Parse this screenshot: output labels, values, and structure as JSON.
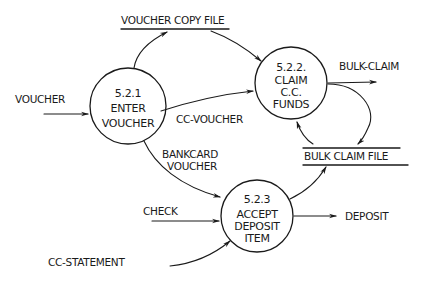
{
  "diagram": {
    "type": "data-flow-diagram",
    "style": "hand-drawn",
    "colors": {
      "ink": "#1a1a1a",
      "background": "#ffffff"
    },
    "processes": [
      {
        "id": "5.2.1",
        "number": "5.2.1",
        "lines": [
          "ENTER",
          "VOUCHER"
        ]
      },
      {
        "id": "5.2.2",
        "number": "5.2.2.",
        "lines": [
          "CLAIM",
          "C.C.",
          "FUNDS"
        ]
      },
      {
        "id": "5.2.3",
        "number": "5.2.3",
        "lines": [
          "ACCEPT",
          "DEPOSIT",
          "ITEM"
        ]
      }
    ],
    "data_stores": [
      {
        "id": "voucher-copy-file",
        "label": "VOUCHER COPY FILE"
      },
      {
        "id": "bulk-claim-file",
        "label": "BULK CLAIM FILE"
      }
    ],
    "flows": [
      {
        "label": "VOUCHER",
        "from": "external",
        "to": "5.2.1"
      },
      {
        "label": "",
        "from": "5.2.1",
        "to": "voucher-copy-file"
      },
      {
        "label": "",
        "from": "voucher-copy-file",
        "to": "5.2.2"
      },
      {
        "label": "CC-VOUCHER",
        "from": "5.2.1",
        "to": "5.2.2"
      },
      {
        "label": "BULK-CLAIM",
        "from": "5.2.2",
        "to": "external"
      },
      {
        "label": "",
        "from": "5.2.2",
        "to": "bulk-claim-file"
      },
      {
        "label": "",
        "from": "bulk-claim-file",
        "to": "5.2.2"
      },
      {
        "label": "BANKCARD VOUCHER",
        "label_lines": [
          "BANKCARD",
          "VOUCHER"
        ],
        "from": "5.2.1",
        "to": "5.2.3"
      },
      {
        "label": "CHECK",
        "from": "external",
        "to": "5.2.3"
      },
      {
        "label": "CC-STATEMENT",
        "from": "external",
        "to": "5.2.3"
      },
      {
        "label": "DEPOSIT",
        "from": "5.2.3",
        "to": "external"
      },
      {
        "label": "",
        "from": "5.2.3",
        "to": "bulk-claim-file"
      }
    ]
  }
}
